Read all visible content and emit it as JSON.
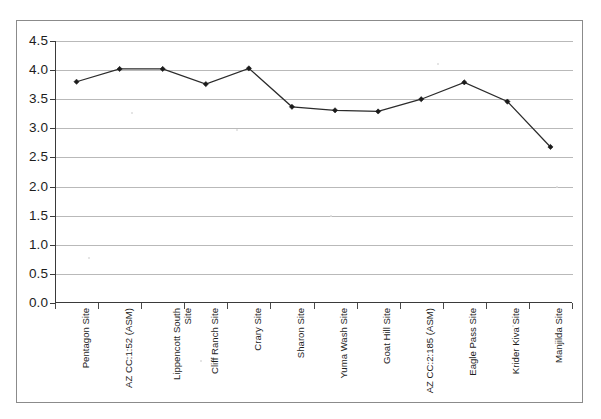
{
  "chart_data": {
    "type": "line",
    "title": "",
    "subtitle": "",
    "xlabel": "",
    "ylabel": "",
    "grid": true,
    "legend": false,
    "legend_position": "none",
    "ylim": [
      0.0,
      4.5
    ],
    "y_ticks": [
      "4.5",
      "4.0",
      "3.5",
      "3.0",
      "2.5",
      "2.0",
      "1.5",
      "1.0",
      "0.5",
      "0.0"
    ],
    "y_tick_values": [
      4.5,
      4.0,
      3.5,
      3.0,
      2.5,
      2.0,
      1.5,
      1.0,
      0.5,
      0.0
    ],
    "categories": [
      "Pentagon Site",
      "AZ CC:1:52 (ASM)",
      "Lippencott South Site",
      "Cliff Ranch Site",
      "Crary Site",
      "Sharon Site",
      "Yuma Wash Site",
      "Goat Hill Site",
      "AZ CC:2:185 (ASM)",
      "Eagle Pass Site",
      "Krider Kiva Site",
      "Manjilda Site"
    ],
    "values": [
      3.8,
      4.02,
      4.02,
      3.76,
      4.03,
      3.37,
      3.31,
      3.29,
      3.5,
      3.79,
      3.46,
      2.68
    ],
    "series": [
      {
        "name": "",
        "values": [
          3.8,
          4.02,
          4.02,
          3.76,
          4.03,
          3.37,
          3.31,
          3.29,
          3.5,
          3.79,
          3.46,
          2.68
        ]
      }
    ],
    "marker": "diamond",
    "line_color": "#2b2b2b",
    "marker_color": "#1b1b1b",
    "gridline_color": "#b9b9b9",
    "axis_color": "#3a3a3a",
    "background_color": "#ffffff"
  }
}
